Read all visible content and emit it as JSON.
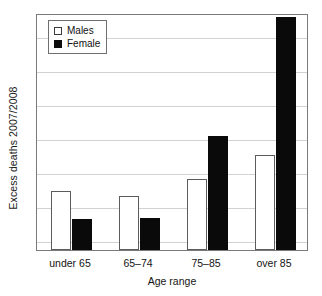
{
  "chart_data": {
    "type": "bar",
    "title": "",
    "xlabel": "Age range",
    "ylabel": "Excess deaths 2007/2008",
    "categories": [
      "under 65",
      "65–74",
      "75–85",
      "over 85"
    ],
    "series": [
      {
        "name": "Males",
        "color": "#ffffff",
        "values": [
          1.74,
          1.59,
          2.09,
          2.82
        ]
      },
      {
        "name": "Female",
        "color": "#0a0a0a",
        "values": [
          0.91,
          0.94,
          3.38,
          6.88
        ]
      }
    ],
    "ylim": [
      0,
      7
    ],
    "ytick_values": [
      0,
      1,
      2,
      3,
      4,
      5,
      6,
      7
    ],
    "ytick_labels": [
      "",
      "",
      "",
      "",
      "",
      "",
      "",
      ""
    ],
    "grid": true,
    "grid_axis": "y",
    "legend_position": "top-left",
    "bar_style": {
      "male_fill": "#ffffff",
      "male_border": "#5c5c5c",
      "female_fill": "#0a0a0a",
      "female_border": "#0a0a0a"
    },
    "frame_color": "#7a7a7a",
    "gridline_color": "#d2d2d2"
  },
  "legend": {
    "items": [
      {
        "label": "Males",
        "swatch": "open-square-swatch"
      },
      {
        "label": "Female",
        "swatch": "filled-square-swatch"
      }
    ]
  },
  "axes": {
    "y_title": "Excess deaths 2007/2008",
    "x_title": "Age range"
  }
}
